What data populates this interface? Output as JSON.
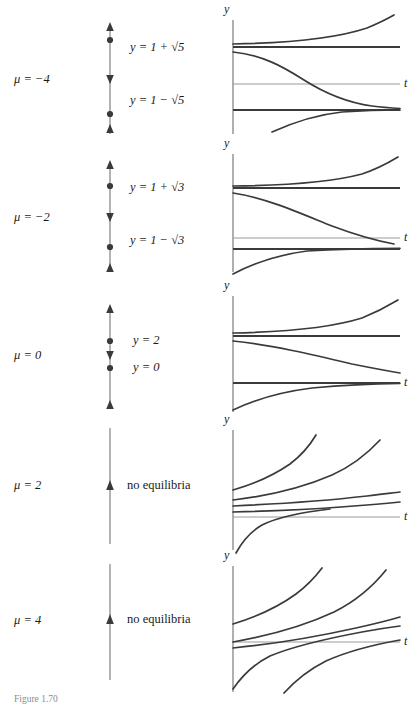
{
  "figure": {
    "caption": "Figure 1.70",
    "width": 409,
    "height": 704,
    "line_color": "#3a3a3a",
    "axis_color": "#6e6e6e",
    "text_color": "#1a1a1a"
  },
  "axis_labels": {
    "vertical": "y",
    "horizontal": "t"
  },
  "panels": [
    {
      "id": "mu-minus-4",
      "mu_label": "μ = −4",
      "top": 10,
      "height": 130,
      "phase_line": {
        "dots": [
          0.26,
          0.74
        ],
        "arrows": [
          {
            "pos": 0.1,
            "dir": "up"
          },
          {
            "pos": 0.5,
            "dir": "down"
          },
          {
            "pos": 0.9,
            "dir": "up"
          }
        ]
      },
      "equilibria": [
        {
          "text": "y = 1 + √5",
          "style": "italic",
          "y": 0.26
        },
        {
          "text": "y = 1 − √5",
          "style": "italic",
          "y": 0.74
        }
      ],
      "plot": {
        "equilibrium_lines": [
          0.28,
          0.78
        ],
        "t_axis": 0.56,
        "solutions": [
          "above-upper-diverge",
          "between-converge-down",
          "below-lower-converge-up"
        ]
      }
    },
    {
      "id": "mu-minus-2",
      "mu_label": "μ = −2",
      "top": 148,
      "height": 130,
      "phase_line": {
        "dots": [
          0.3,
          0.7
        ],
        "arrows": [
          {
            "pos": 0.1,
            "dir": "up"
          },
          {
            "pos": 0.5,
            "dir": "down"
          },
          {
            "pos": 0.92,
            "dir": "up"
          }
        ]
      },
      "equilibria": [
        {
          "text": "y = 1 + √3",
          "style": "italic",
          "y": 0.3
        },
        {
          "text": "y = 1 − √3",
          "style": "italic",
          "y": 0.7
        }
      ],
      "plot": {
        "equilibrium_lines": [
          0.28,
          0.78
        ],
        "t_axis": 0.68,
        "solutions": [
          "above-upper-diverge",
          "between-converge-down",
          "below-lower-converge-up"
        ]
      }
    },
    {
      "id": "mu-0",
      "mu_label": "μ = 0",
      "top": 288,
      "height": 126,
      "phase_line": {
        "dots": [
          0.38,
          0.62
        ],
        "arrows": [
          {
            "pos": 0.08,
            "dir": "up"
          },
          {
            "pos": 0.5,
            "dir": "down"
          },
          {
            "pos": 0.93,
            "dir": "up"
          }
        ]
      },
      "equilibria": [
        {
          "text": "y = 2",
          "style": "italic",
          "y": 0.38
        },
        {
          "text": "y = 0",
          "style": "italic",
          "y": 0.62
        }
      ],
      "plot": {
        "equilibrium_lines": [
          0.36,
          0.72
        ],
        "t_axis": 0.72,
        "solutions": [
          "above-upper-diverge",
          "between-converge-down",
          "below-lower-converge-up"
        ]
      }
    },
    {
      "id": "mu-2",
      "mu_label": "μ = 2",
      "top": 420,
      "height": 130,
      "phase_line": {
        "dots": [],
        "arrows": [
          {
            "pos": 0.5,
            "dir": "up"
          }
        ]
      },
      "equilibria": [
        {
          "text": "no equilibria",
          "style": "roman",
          "y": 0.5
        }
      ],
      "plot": {
        "equilibrium_lines": [],
        "t_axis": 0.74,
        "solutions": [
          "rising-1",
          "rising-2",
          "rising-3",
          "rising-4"
        ]
      }
    },
    {
      "id": "mu-4",
      "mu_label": "μ = 4",
      "top": 556,
      "height": 134,
      "phase_line": {
        "dots": [],
        "arrows": [
          {
            "pos": 0.5,
            "dir": "up"
          }
        ]
      },
      "equilibria": [
        {
          "text": "no equilibria",
          "style": "roman",
          "y": 0.5
        }
      ],
      "plot": {
        "equilibrium_lines": [],
        "t_axis": 0.72,
        "solutions": [
          "rising-1",
          "rising-2",
          "rising-3",
          "rising-4"
        ]
      }
    }
  ]
}
